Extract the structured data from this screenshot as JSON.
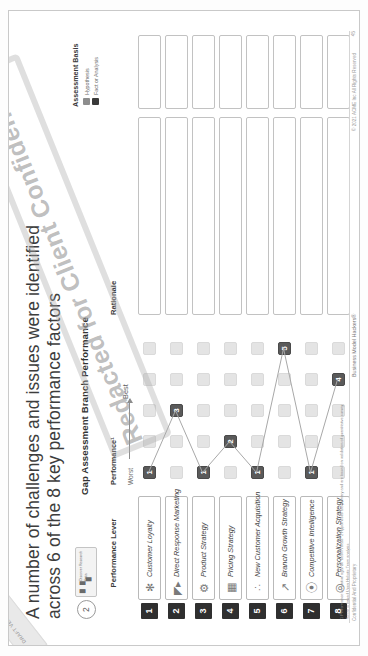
{
  "slide": {
    "corner_tab": "DRAFT VERSION",
    "title": "A number of challenges and issues were identified across 6 of the 8 key performance factors",
    "step_number": "2",
    "step_chip_icon": "bar-chart-icon",
    "step_chip_label": "Discover Research Data",
    "chart_heading": "Gap Assessment Branch Performance",
    "page_number": "45"
  },
  "columns": {
    "lever": "Performance Lever",
    "performance": "Performance¹",
    "rationale": "Rationale",
    "assessment_basis": "Assessment Basis"
  },
  "axis": {
    "worst": "Worst",
    "best": "Best"
  },
  "legend": {
    "items": [
      {
        "label": "Hypothesis",
        "color": "#8d8d8d"
      },
      {
        "label": "Fact or Analysis",
        "color": "#3a3a3a"
      }
    ]
  },
  "redaction_watermark": "Redacted for Client Confidentiality",
  "footnotes": [
    "1  Performance is relative against \"best in class\"  2  Hypotheses are primary and are based on validation of quantitative survey",
    "Score is based Upon Holistic  Team analysis"
  ],
  "footer": {
    "left": "Confidential And Proprietary",
    "center": "Business Model Hackers®",
    "right": "© 2021 ACME Inc All Rights Reserved"
  },
  "chart_data": {
    "type": "table",
    "title": "Gap Assessment Branch Performance",
    "xlabel": "Performance (Worst → Best)",
    "ylabel": "Performance Lever",
    "scale_min": 1,
    "scale_max": 5,
    "categories": [
      "Customer Loyalty",
      "Direct Response Marketing",
      "Product Strategy",
      "Pricing Strategy",
      "New Customer Acquisition",
      "Branch Growth Strategy",
      "Competitive Intelligence",
      "Personalization Strategy"
    ],
    "values": [
      1,
      3,
      1,
      2,
      1,
      5,
      1,
      4
    ],
    "legend_position": "top-right",
    "grid": false
  },
  "rows": [
    {
      "rank": "1",
      "icon": "loyalty-badge-icon",
      "label": "Customer Loyalty",
      "score": 1,
      "rationale": "",
      "basis": ""
    },
    {
      "rank": "2",
      "icon": "megaphone-icon",
      "label": "Direct Response Marketing",
      "score": 3,
      "rationale": "",
      "basis": ""
    },
    {
      "rank": "3",
      "icon": "product-box-icon",
      "label": "Product Strategy",
      "score": 1,
      "rationale": "",
      "basis": ""
    },
    {
      "rank": "4",
      "icon": "price-tag-icon",
      "label": "Pricing Strategy",
      "score": 2,
      "rationale": "",
      "basis": ""
    },
    {
      "rank": "5",
      "icon": "people-group-icon",
      "label": "New Customer Acquisition",
      "score": 1,
      "rationale": "",
      "basis": ""
    },
    {
      "rank": "6",
      "icon": "growth-chart-icon",
      "label": "Branch Growth Strategy",
      "score": 5,
      "rationale": "",
      "basis": ""
    },
    {
      "rank": "7",
      "icon": "binoculars-icon",
      "label": "Competitive Intelligence",
      "score": 1,
      "rationale": "",
      "basis": ""
    },
    {
      "rank": "8",
      "icon": "user-target-icon",
      "label": "Personalization Strategy",
      "score": 4,
      "rationale": "",
      "basis": ""
    }
  ]
}
